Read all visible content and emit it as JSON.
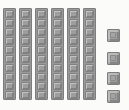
{
  "scene": {
    "title": "Base ten blocks",
    "description": "Six vertical ten-rods and four single unit cubes",
    "background_color": "#fbfbfa",
    "block_fill_color": "#9e9e9e",
    "block_outline_color": "#7d7d7d"
  },
  "chart_data": {
    "type": "table",
    "title": "Base ten blocks",
    "xlabel": "",
    "ylabel": "",
    "categories": [
      "tens rods",
      "ones cubes"
    ],
    "values": [
      6,
      4
    ],
    "unit_value_per_rod": 10,
    "unit_value_per_cube": 1,
    "total": 64,
    "annotations": []
  },
  "rods": {
    "count": 6,
    "units_per_rod": 10,
    "label": "ten-rod",
    "items": [
      {
        "index": 1,
        "value": 10
      },
      {
        "index": 2,
        "value": 10
      },
      {
        "index": 3,
        "value": 10
      },
      {
        "index": 4,
        "value": 10
      },
      {
        "index": 5,
        "value": 10
      },
      {
        "index": 6,
        "value": 10
      }
    ]
  },
  "cubes": {
    "count": 4,
    "label": "unit-cube",
    "items": [
      {
        "index": 1,
        "value": 1
      },
      {
        "index": 2,
        "value": 1
      },
      {
        "index": 3,
        "value": 1
      },
      {
        "index": 4,
        "value": 1
      }
    ]
  }
}
